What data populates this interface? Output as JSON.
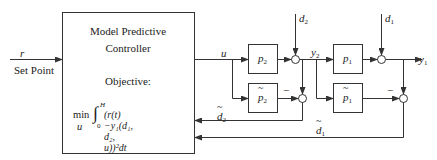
{
  "diagram": {
    "controller": {
      "line1": "Model Predictive",
      "line2": "Controller",
      "objective_label": "Objective:",
      "objective_min": "min",
      "objective_var": "u",
      "integral_upper": "H",
      "integral_lower": "0",
      "objective_expr": "(r(t)−y₁(d₁, d₂, u))²dt"
    },
    "input": {
      "signal": "r",
      "label": "Set Point"
    },
    "signals": {
      "u": "u",
      "d2": "d",
      "d2_sub": "2",
      "d1": "d",
      "d1_sub": "1",
      "y2": "y",
      "y2_sub": "2",
      "y1": "y",
      "y1_sub": "1",
      "d2_est": "d",
      "d2_est_sub": "2",
      "d1_est": "d",
      "d1_est_sub": "1",
      "minus": "−"
    },
    "blocks": [
      {
        "id": "p2",
        "label": "p",
        "sub": "2",
        "model": false
      },
      {
        "id": "p2_model",
        "label": "p",
        "sub": "2",
        "model": true
      },
      {
        "id": "p1",
        "label": "p",
        "sub": "1",
        "model": false
      },
      {
        "id": "p1_model",
        "label": "p",
        "sub": "1",
        "model": true
      }
    ],
    "colors": {
      "line": "#333333",
      "background": "#ffffff"
    }
  }
}
